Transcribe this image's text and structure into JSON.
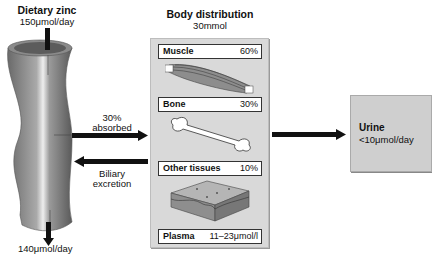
{
  "intake": {
    "title": "Dietary zinc",
    "amount": "150μmol/day"
  },
  "body_distribution": {
    "title": "Body distribution",
    "total": "30mmol",
    "compartments": [
      {
        "name": "Muscle",
        "value": "60%",
        "icon": "muscle-icon"
      },
      {
        "name": "Bone",
        "value": "30%",
        "icon": "bone-icon"
      },
      {
        "name": "Other tissues",
        "value": "10%",
        "icon": "tissue-icon"
      },
      {
        "name": "Plasma",
        "value": "11–23μmol/l"
      }
    ]
  },
  "flows": {
    "absorbed": {
      "line1": "30%",
      "line2": "absorbed"
    },
    "biliary": {
      "line1": "Biliary",
      "line2": "excretion"
    },
    "fecal": "140μmol/day"
  },
  "urine": {
    "title": "Urine",
    "amount": "<10μmol/day"
  },
  "colors": {
    "box_fill": "#d9d9d9",
    "urine_fill": "#cfcfcf",
    "arrow": "#111111"
  }
}
